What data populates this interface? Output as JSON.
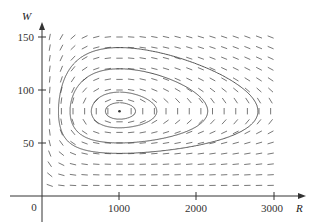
{
  "chart_data": {
    "type": "direction-field",
    "title": "",
    "xlabel": "R",
    "ylabel": "W",
    "xlim": [
      0,
      3000
    ],
    "ylim": [
      0,
      150
    ],
    "x_ticks": [
      1000,
      2000,
      3000
    ],
    "x_tick_labels": [
      "1000",
      "2000",
      "3000"
    ],
    "y_ticks": [
      50,
      100,
      150
    ],
    "y_tick_labels": [
      "50",
      "100",
      "150"
    ],
    "origin_label": "0",
    "grid": false,
    "legend": null,
    "equilibrium": {
      "R": 1000,
      "W": 80
    },
    "field_grid": {
      "R_start": 100,
      "R_step": 150,
      "R_end": 2950,
      "W_start": 10,
      "W_step": 10,
      "W_end": 150
    },
    "trajectories": [
      {
        "name": "orbit-1",
        "R_min": 850,
        "R_max": 1300,
        "W_min": 72,
        "W_max": 88
      },
      {
        "name": "orbit-2",
        "R_min": 650,
        "R_max": 1700,
        "W_min": 62,
        "W_max": 98
      },
      {
        "name": "orbit-3",
        "R_min": 480,
        "R_max": 2300,
        "W_min": 52,
        "W_max": 120
      },
      {
        "name": "orbit-4",
        "R_min": 360,
        "R_max": 3000,
        "W_min": 40,
        "W_max": 140
      }
    ]
  },
  "axes": {
    "x_label": "R",
    "y_label": "W",
    "origin": "0",
    "x_ticks": [
      "1000",
      "2000",
      "3000"
    ],
    "y_ticks": [
      "50",
      "100",
      "150"
    ]
  }
}
